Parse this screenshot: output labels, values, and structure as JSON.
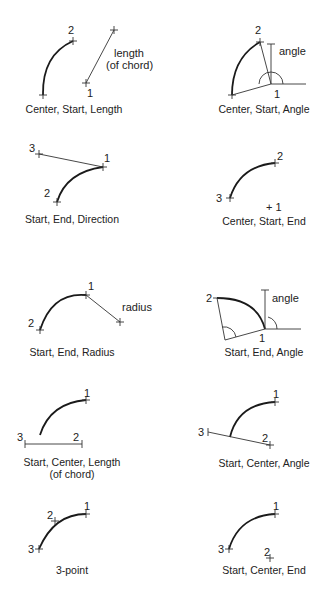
{
  "diagram": {
    "colors": {
      "background": "#ffffff",
      "stroke": "#1a1a1a",
      "text": "#222222"
    },
    "panels": [
      {
        "caption": "Center, Start, Length",
        "labels": {
          "p1": "1",
          "p2": "2",
          "note1": "length",
          "note2": "(of chord)"
        }
      },
      {
        "caption": "Center, Start, Angle",
        "labels": {
          "p1": "1",
          "p2": "2",
          "note1": "angle"
        }
      },
      {
        "caption": "Start, End, Direction",
        "labels": {
          "p1": "1",
          "p2": "2",
          "p3": "3"
        }
      },
      {
        "caption": "Center, Start, End",
        "labels": {
          "p1": "+ 1",
          "p2": "2",
          "p3": "3"
        }
      },
      {
        "caption": "Start, End, Radius",
        "labels": {
          "p1": "1",
          "p2": "2",
          "note1": "radius"
        }
      },
      {
        "caption": "Start, End, Angle",
        "labels": {
          "p1": "1",
          "p2": "2",
          "note1": "angle"
        }
      },
      {
        "caption": "Start, Center, Length",
        "caption2": "(of chord)",
        "labels": {
          "p1": "1",
          "p2": "2",
          "p3": "3"
        }
      },
      {
        "caption": "Start, Center, Angle",
        "labels": {
          "p1": "1",
          "p2": "2",
          "p3": "3"
        }
      },
      {
        "caption": "3-point",
        "labels": {
          "p1": "1",
          "p2": "2",
          "p3": "3"
        }
      },
      {
        "caption": "Start, Center, End",
        "labels": {
          "p1": "1",
          "p2": "2",
          "p3": "3"
        }
      }
    ]
  }
}
